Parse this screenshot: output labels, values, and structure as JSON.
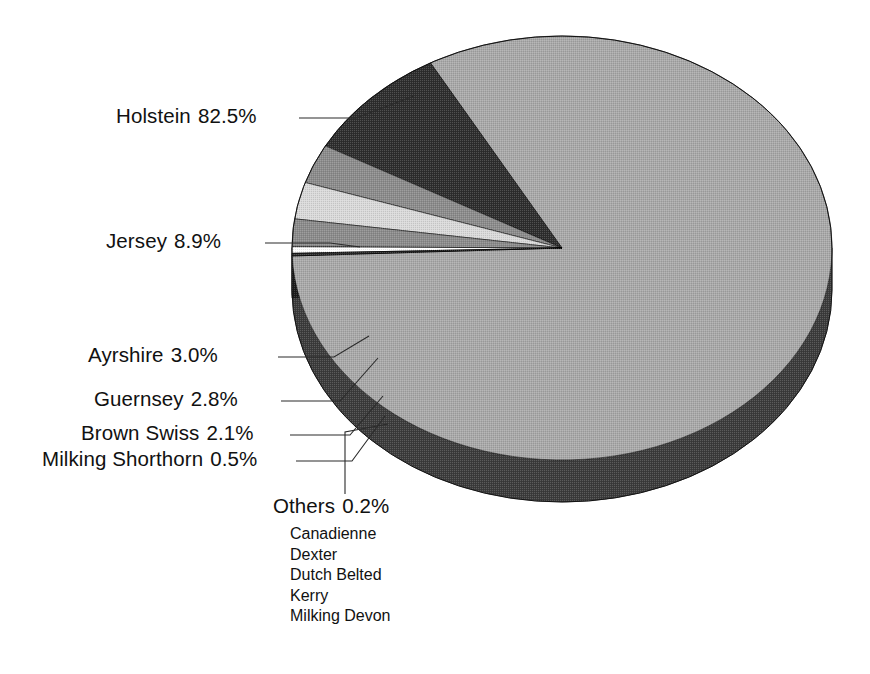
{
  "chart_data": {
    "type": "pie",
    "title": "",
    "subtitle": "",
    "xlabel": "",
    "ylabel": "",
    "legend_position": "none",
    "grid": false,
    "three_d": true,
    "units": "percent",
    "total": 100.0,
    "categories": [
      "Holstein",
      "Jersey",
      "Ayrshire",
      "Guernsey",
      "Brown Swiss",
      "Milking Shorthorn",
      "Others"
    ],
    "values": [
      82.5,
      8.9,
      3.0,
      2.8,
      2.1,
      0.5,
      0.2
    ],
    "value_labels": [
      "82.5%",
      "8.9%",
      "3.0%",
      "2.8%",
      "2.1%",
      "0.5%",
      "0.2%"
    ],
    "colors": [
      "#a9a9a9",
      "#2e2e2e",
      "#8c8c8c",
      "#dadada",
      "#8c8c8c",
      "#ffffff",
      "#333333"
    ],
    "side_colors": [
      "#3c3c3c",
      "#151515",
      "#303030",
      "#555555",
      "#303030",
      "#707070",
      "#1a1a1a"
    ],
    "annotations": [
      "Canadienne",
      "Dexter",
      "Dutch Belted",
      "Kerry",
      "Milking Devon"
    ]
  },
  "slices": [
    {
      "name": "Holstein",
      "pct": 82.5,
      "label": "Holstein",
      "value_label": "82.5%",
      "fill": "#a9a9a9",
      "side": "#3c3c3c"
    },
    {
      "name": "Jersey",
      "pct": 8.9,
      "label": "Jersey",
      "value_label": "8.9%",
      "fill": "#2e2e2e",
      "side": "#151515"
    },
    {
      "name": "Ayrshire",
      "pct": 3.0,
      "label": "Ayrshire",
      "value_label": "3.0%",
      "fill": "#8c8c8c",
      "side": "#303030"
    },
    {
      "name": "Guernsey",
      "pct": 2.8,
      "label": "Guernsey",
      "value_label": "2.8%",
      "fill": "#dadada",
      "side": "#555555"
    },
    {
      "name": "Brown Swiss",
      "pct": 2.1,
      "label": "Brown Swiss",
      "value_label": "2.1%",
      "fill": "#8c8c8c",
      "side": "#303030"
    },
    {
      "name": "Milking Shorthorn",
      "pct": 0.5,
      "label": "Milking Shorthorn",
      "value_label": "0.5%",
      "fill": "#ffffff",
      "side": "#707070"
    },
    {
      "name": "Others",
      "pct": 0.2,
      "label": "Others",
      "value_label": "0.2%",
      "fill": "#333333",
      "side": "#1a1a1a"
    }
  ],
  "labels": {
    "holstein": {
      "name": "Holstein",
      "value": "82.5%"
    },
    "jersey": {
      "name": "Jersey",
      "value": "8.9%"
    },
    "ayrshire": {
      "name": "Ayrshire",
      "value": "3.0%"
    },
    "guernsey": {
      "name": "Guernsey",
      "value": "2.8%"
    },
    "brown_swiss": {
      "name": "Brown Swiss",
      "value": "2.1%"
    },
    "milking_shorthorn": {
      "name": "Milking Shorthorn",
      "value": "0.5%"
    },
    "others": {
      "name": "Others",
      "value": "0.2%"
    }
  },
  "others_breakdown": {
    "heading": "Others",
    "items": [
      "Canadienne",
      "Dexter",
      "Dutch Belted",
      "Kerry",
      "Milking Devon"
    ]
  },
  "geometry": {
    "center_x": 562,
    "center_y": 248,
    "radius_x": 270,
    "radius_y": 212,
    "depth": 42
  }
}
